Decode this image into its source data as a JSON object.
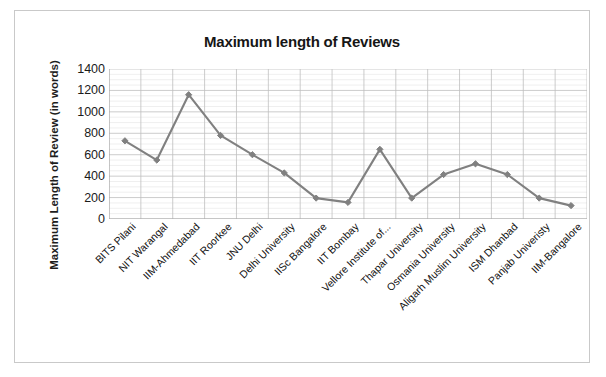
{
  "chart_data": {
    "type": "line",
    "title": "Maximum length of Reviews",
    "xlabel": "",
    "ylabel": "Maximum Length of Review (in words)",
    "ylim": [
      0,
      1400
    ],
    "yticks": [
      1400,
      1200,
      1000,
      800,
      600,
      400,
      200,
      0
    ],
    "grid": true,
    "legend": "none",
    "categories": [
      "BITS Pilani",
      "NIT Warangal",
      "IIM-Ahmedabad",
      "IIT Roorkee",
      "JNU Delhi",
      "Delhi University",
      "IISc Bangalore",
      "IIT Bombay",
      "Vellore Institute of...",
      "Thapar University",
      "Osmania University",
      "Aligarh Muslim University",
      "ISM Dhanbad",
      "Panjab Univeristy",
      "IIM-Bangalore"
    ],
    "values": [
      730,
      550,
      1160,
      780,
      600,
      430,
      195,
      155,
      650,
      195,
      415,
      515,
      415,
      195,
      125
    ],
    "series_color": "#808080",
    "marker": "diamond"
  },
  "style": {
    "frame_border_color": "#c9c9c9",
    "grid_major_color": "#bfbfbf",
    "grid_minor_color": "#dedede",
    "axis_color": "#a6a6a6",
    "text_color": "#1b1b1b"
  }
}
